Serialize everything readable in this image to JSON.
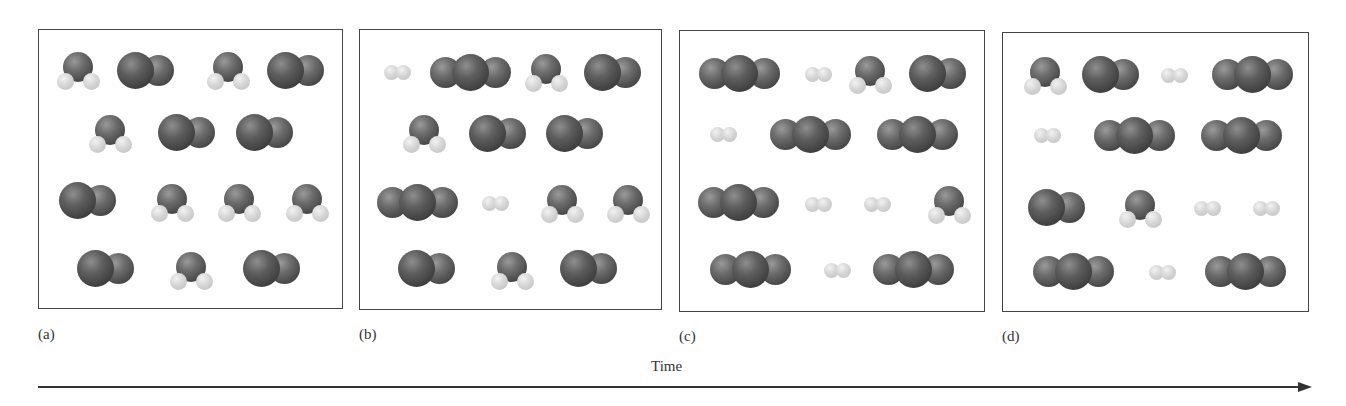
{
  "figure": {
    "time_axis_label": "Time",
    "molecule_legend": {
      "H2O": "bent molecule: one dark oxygen atom with two light hydrogen atoms",
      "CO": "two dark atoms (carbon + oxygen)",
      "CO2": "three dark atoms in a line",
      "H2": "two small light atoms"
    },
    "colors": {
      "dark_atom": "#4a4a4a",
      "light_atom": "#d0d0d0",
      "frame": "#444444"
    },
    "panels": [
      {
        "label": "(a)",
        "box": [
          38,
          29,
          305,
          280
        ],
        "counts": {
          "H2O": 7,
          "CO": 7,
          "CO2": 0,
          "H2": 0
        },
        "molecules": [
          {
            "type": "H2O",
            "x": 78,
            "y": 70
          },
          {
            "type": "CO",
            "x": 146,
            "y": 70
          },
          {
            "type": "H2O",
            "x": 228,
            "y": 70
          },
          {
            "type": "CO",
            "x": 296,
            "y": 70
          },
          {
            "type": "H2O",
            "x": 110,
            "y": 133
          },
          {
            "type": "CO",
            "x": 187,
            "y": 132
          },
          {
            "type": "CO",
            "x": 265,
            "y": 132
          },
          {
            "type": "CO",
            "x": 88,
            "y": 200
          },
          {
            "type": "H2O",
            "x": 172,
            "y": 202
          },
          {
            "type": "H2O",
            "x": 239,
            "y": 202
          },
          {
            "type": "H2O",
            "x": 307,
            "y": 202
          },
          {
            "type": "CO",
            "x": 106,
            "y": 268
          },
          {
            "type": "H2O",
            "x": 191,
            "y": 270
          },
          {
            "type": "CO",
            "x": 272,
            "y": 268
          }
        ]
      },
      {
        "label": "(b)",
        "box": [
          359,
          29,
          303,
          281
        ],
        "counts": {
          "H2O": 5,
          "CO": 5,
          "CO2": 2,
          "H2": 2
        },
        "molecules": [
          {
            "type": "H2",
            "x": 397,
            "y": 72
          },
          {
            "type": "CO2",
            "x": 470,
            "y": 72
          },
          {
            "type": "H2O",
            "x": 546,
            "y": 72
          },
          {
            "type": "CO",
            "x": 613,
            "y": 72
          },
          {
            "type": "H2O",
            "x": 424,
            "y": 133
          },
          {
            "type": "CO",
            "x": 498,
            "y": 133
          },
          {
            "type": "CO",
            "x": 575,
            "y": 133
          },
          {
            "type": "CO2",
            "x": 417,
            "y": 202
          },
          {
            "type": "H2",
            "x": 495,
            "y": 203
          },
          {
            "type": "H2O",
            "x": 562,
            "y": 203
          },
          {
            "type": "H2O",
            "x": 628,
            "y": 203
          },
          {
            "type": "CO",
            "x": 427,
            "y": 268
          },
          {
            "type": "H2O",
            "x": 512,
            "y": 270
          },
          {
            "type": "CO",
            "x": 589,
            "y": 268
          }
        ]
      },
      {
        "label": "(c)",
        "box": [
          679,
          30,
          306,
          282
        ],
        "counts": {
          "H2O": 2,
          "CO": 2,
          "CO2": 5,
          "H2": 5
        },
        "molecules": [
          {
            "type": "CO2",
            "x": 739,
            "y": 73
          },
          {
            "type": "H2",
            "x": 818,
            "y": 74
          },
          {
            "type": "H2O",
            "x": 870,
            "y": 74
          },
          {
            "type": "CO",
            "x": 938,
            "y": 73
          },
          {
            "type": "H2",
            "x": 723,
            "y": 134
          },
          {
            "type": "CO2",
            "x": 810,
            "y": 134
          },
          {
            "type": "CO2",
            "x": 917,
            "y": 134
          },
          {
            "type": "CO2",
            "x": 738,
            "y": 202
          },
          {
            "type": "H2",
            "x": 818,
            "y": 204
          },
          {
            "type": "H2",
            "x": 877,
            "y": 204
          },
          {
            "type": "H2O",
            "x": 949,
            "y": 204
          },
          {
            "type": "CO2",
            "x": 750,
            "y": 269
          },
          {
            "type": "H2",
            "x": 837,
            "y": 270
          },
          {
            "type": "CO2",
            "x": 913,
            "y": 269
          }
        ]
      },
      {
        "label": "(d)",
        "box": [
          1002,
          32,
          307,
          280
        ],
        "counts": {
          "H2O": 2,
          "CO": 2,
          "CO2": 5,
          "H2": 5
        },
        "molecules": [
          {
            "type": "H2O",
            "x": 1045,
            "y": 75
          },
          {
            "type": "CO",
            "x": 1111,
            "y": 74
          },
          {
            "type": "H2",
            "x": 1174,
            "y": 75
          },
          {
            "type": "CO2",
            "x": 1252,
            "y": 74
          },
          {
            "type": "H2",
            "x": 1047,
            "y": 135
          },
          {
            "type": "CO2",
            "x": 1134,
            "y": 135
          },
          {
            "type": "CO2",
            "x": 1241,
            "y": 135
          },
          {
            "type": "CO",
            "x": 1057,
            "y": 207
          },
          {
            "type": "H2O",
            "x": 1140,
            "y": 208
          },
          {
            "type": "H2",
            "x": 1207,
            "y": 208
          },
          {
            "type": "H2",
            "x": 1266,
            "y": 208
          },
          {
            "type": "CO2",
            "x": 1073,
            "y": 271
          },
          {
            "type": "H2",
            "x": 1162,
            "y": 272
          },
          {
            "type": "CO2",
            "x": 1245,
            "y": 271
          }
        ]
      }
    ]
  }
}
